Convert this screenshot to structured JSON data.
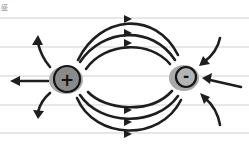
{
  "diagram": {
    "corner_mark": "盛",
    "background": "#ffffff",
    "ruled_lines_y": [
      18,
      47,
      76,
      105,
      133
    ],
    "charges": [
      {
        "id": "positive",
        "sign": "+",
        "x": 67,
        "y": 79,
        "color": "#8a8a8a"
      },
      {
        "id": "negative",
        "sign": "-",
        "x": 185,
        "y": 77,
        "color": "#b4b4b4"
      }
    ],
    "field_lines": {
      "between_top": 3,
      "between_bottom": 3,
      "outward_from_positive": 3,
      "inward_to_negative": 3,
      "direction": "positive to negative"
    },
    "colors": {
      "line": "#1e1e1e",
      "rule": "#cfcfcf",
      "charge_halo": "#a9a9a9"
    }
  }
}
